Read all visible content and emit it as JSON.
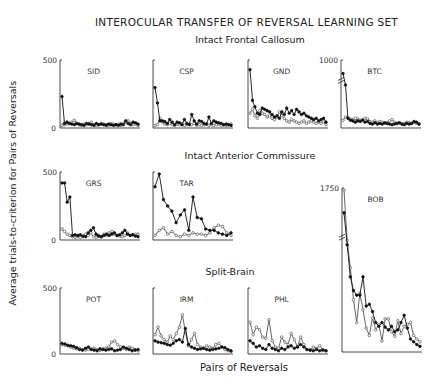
{
  "figure": {
    "title": "INTEROCULAR TRANSFER OF REVERSAL LEARNING SET",
    "groups": {
      "frontal": "Intact Frontal Callosum",
      "anterior": "Intact Anterior Commissure",
      "split": "Split-Brain"
    },
    "ylabel": "Average trials-to-criterion for Pairs of Reversals",
    "xlabel": "Pairs of Reversals"
  },
  "chart_data": {
    "type": "line",
    "title": "INTEROCULAR TRANSFER OF REVERSAL LEARNING SET",
    "xlabel": "Pairs of Reversals",
    "ylabel": "Average trials-to-criterion for Pairs of Reversals",
    "legend": [
      "filled circles: eye 1 (trained)",
      "open circles: eye 2 (transfer)"
    ],
    "panels": [
      {
        "name": "SID",
        "group": "Intact Frontal Callosum",
        "box": [
          60,
          60,
          140,
          128
        ],
        "ymax": 500,
        "yticks": [
          "500",
          "0"
        ],
        "filled": [
          230,
          20,
          30,
          20,
          15,
          10,
          20,
          15,
          10,
          5,
          20,
          15,
          10,
          5,
          20,
          10,
          15,
          10,
          5,
          15,
          10,
          5,
          10,
          5,
          15,
          10,
          40,
          20,
          10,
          30,
          25,
          15
        ],
        "open": [
          5,
          10,
          15,
          20,
          30,
          45,
          20,
          10,
          5,
          15,
          10,
          20,
          30,
          10,
          5,
          10,
          20,
          15,
          10,
          5,
          20,
          15,
          10,
          15,
          5,
          20,
          30,
          40,
          20,
          10,
          15,
          5
        ]
      },
      {
        "name": "CSP",
        "group": "Intact Frontal Callosum",
        "box": [
          153,
          60,
          233,
          128
        ],
        "ymax": 500,
        "yticks": [],
        "filled": [
          300,
          180,
          40,
          40,
          35,
          20,
          50,
          30,
          10,
          30,
          25,
          10,
          50,
          20,
          10,
          90,
          40,
          15,
          40,
          35,
          20,
          15,
          70,
          20,
          40,
          30,
          25,
          20,
          10,
          15,
          10,
          5
        ],
        "open": [
          5,
          10,
          60,
          30,
          15,
          10,
          20,
          10,
          5,
          15,
          10,
          20,
          5,
          10,
          15,
          10,
          20,
          5,
          10,
          5,
          10,
          15,
          5,
          10,
          5,
          10,
          15,
          5,
          10,
          5,
          10,
          15
        ]
      },
      {
        "name": "GND",
        "group": "Intact Frontal Callosum",
        "box": [
          248,
          60,
          328,
          128
        ],
        "ymax": 500,
        "yticks": [],
        "filled": [
          440,
          200,
          150,
          100,
          90,
          140,
          130,
          120,
          110,
          90,
          70,
          80,
          60,
          110,
          90,
          140,
          100,
          120,
          90,
          130,
          110,
          90,
          100,
          80,
          70,
          60,
          50,
          60,
          40,
          50,
          60,
          30
        ],
        "open": [
          100,
          130,
          80,
          60,
          120,
          100,
          90,
          70,
          80,
          60,
          50,
          70,
          110,
          80,
          60,
          40,
          30,
          50,
          40,
          30,
          20,
          30,
          40,
          20,
          30,
          40,
          30,
          20,
          30,
          20,
          30,
          10
        ]
      },
      {
        "name": "BTC",
        "group": "Intact Frontal Callosum",
        "box": [
          341,
          60,
          421,
          128
        ],
        "ymax": 1000,
        "yticks": [
          "1000"
        ],
        "break": true,
        "filled": [
          820,
          640,
          120,
          90,
          80,
          60,
          80,
          70,
          90,
          60,
          70,
          40,
          30,
          50,
          30,
          40,
          30,
          50,
          40,
          30,
          20,
          30,
          40,
          50,
          30,
          20,
          40,
          30,
          40,
          70,
          60,
          30
        ],
        "open": [
          90,
          140,
          130,
          110,
          100,
          120,
          110,
          90,
          100,
          120,
          110,
          70,
          60,
          80,
          50,
          70,
          60,
          40,
          50,
          80,
          100,
          60,
          40,
          50,
          30,
          40,
          60,
          50,
          40,
          60,
          40,
          30
        ]
      },
      {
        "name": "GRS",
        "group": "Intact Anterior Commissure",
        "box": [
          60,
          172,
          140,
          240
        ],
        "ymax": 500,
        "yticks": [
          "500",
          "0"
        ],
        "filled": [
          430,
          430,
          280,
          320,
          20,
          25,
          20,
          25,
          15,
          10,
          40,
          60,
          80,
          30,
          15,
          10,
          20,
          30,
          20,
          30,
          40,
          20,
          25,
          40,
          60,
          30,
          20,
          25,
          15,
          10
        ],
        "open": [
          70,
          50,
          30,
          20,
          10,
          5,
          10,
          5,
          10,
          30,
          20,
          40,
          10,
          5,
          20,
          10,
          30,
          20,
          40,
          50,
          30,
          20,
          15,
          10,
          20,
          40,
          20,
          25,
          30,
          30
        ]
      },
      {
        "name": "TAR",
        "group": "Intact Anterior Commissure",
        "box": [
          153,
          172,
          233,
          240
        ],
        "ymax": 500,
        "yticks": [],
        "filled": [
          400,
          560,
          300,
          250,
          210,
          120,
          180,
          220,
          60,
          320,
          160,
          150,
          70,
          60,
          60,
          40,
          30,
          20,
          40
        ],
        "open": [
          20,
          60,
          80,
          30,
          50,
          20,
          10,
          30,
          20,
          40,
          30,
          30,
          20,
          40,
          80,
          100,
          90,
          40,
          20
        ]
      },
      {
        "name": "BOB",
        "group": "Intact Anterior Commissure",
        "box": [
          342,
          188,
          422,
          352
        ],
        "ymax": 1750,
        "yticks": [
          "1750"
        ],
        "break": true,
        "filled": [
          1500,
          1150,
          800,
          650,
          600,
          600,
          800,
          480,
          500,
          420,
          300,
          260,
          300,
          250,
          220,
          260,
          200,
          220,
          300,
          380,
          240,
          120,
          90,
          60,
          40
        ],
        "open": [
          1750,
          1200,
          900,
          550,
          300,
          620,
          440,
          240,
          160,
          350,
          220,
          280,
          100,
          340,
          340,
          200,
          150,
          320,
          180,
          260,
          280,
          300,
          160,
          120,
          90
        ]
      },
      {
        "name": "POT",
        "group": "Split-Brain",
        "box": [
          60,
          288,
          140,
          354
        ],
        "ymax": 500,
        "yticks": [
          "500",
          "0"
        ],
        "filled": [
          70,
          65,
          55,
          50,
          45,
          35,
          20,
          15,
          30,
          40,
          20,
          15,
          10,
          25,
          20,
          15,
          20,
          25,
          10,
          15,
          20,
          40,
          30,
          20,
          10,
          15,
          20
        ],
        "open": [
          60,
          55,
          50,
          40,
          30,
          25,
          30,
          20,
          15,
          20,
          25,
          30,
          20,
          15,
          25,
          30,
          40,
          80,
          90,
          60,
          40,
          30,
          20,
          40,
          30,
          20,
          10
        ]
      },
      {
        "name": "IRM",
        "group": "Split-Brain",
        "box": [
          153,
          288,
          233,
          354
        ],
        "ymax": 500,
        "yticks": [],
        "filled": [
          90,
          80,
          75,
          70,
          60,
          55,
          70,
          90,
          100,
          80,
          190,
          60,
          40,
          30,
          20,
          25,
          30,
          20,
          15,
          20,
          25,
          30,
          40,
          35,
          20,
          10
        ],
        "open": [
          140,
          200,
          130,
          100,
          80,
          130,
          100,
          150,
          200,
          300,
          160,
          50,
          100,
          150,
          60,
          40,
          30,
          50,
          40,
          30,
          60,
          70,
          40,
          20,
          10,
          5
        ]
      },
      {
        "name": "PHL",
        "group": "Split-Brain",
        "box": [
          248,
          288,
          328,
          354
        ],
        "ymax": 500,
        "yticks": [],
        "filled": [
          90,
          70,
          40,
          50,
          30,
          20,
          60,
          30,
          20,
          10,
          30,
          20,
          40,
          50,
          30,
          40,
          60,
          40,
          20,
          15,
          10,
          20,
          10,
          15,
          10
        ],
        "open": [
          240,
          140,
          200,
          180,
          120,
          110,
          260,
          90,
          40,
          30,
          120,
          80,
          60,
          150,
          100,
          40,
          120,
          60,
          20,
          15,
          40,
          30,
          50,
          20,
          10
        ]
      }
    ]
  }
}
